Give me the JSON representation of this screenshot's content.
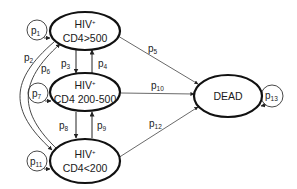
{
  "diagram": {
    "type": "state-transition",
    "nodes": [
      {
        "id": "n1",
        "line1": "HIV",
        "sup": "+",
        "line2": "CD4>500"
      },
      {
        "id": "n2",
        "line1": "HIV",
        "sup": "+",
        "line2": "CD4 200-500"
      },
      {
        "id": "n3",
        "line1": "HIV",
        "sup": "+",
        "line2": "CD4<200"
      },
      {
        "id": "dead",
        "label": "DEAD"
      }
    ],
    "edges": [
      {
        "from": "n1",
        "to": "n1",
        "base": "p",
        "sub": "1"
      },
      {
        "from": "n1",
        "to": "n3",
        "base": "p",
        "sub": "2"
      },
      {
        "from": "n1",
        "to": "n2",
        "base": "p",
        "sub": "3"
      },
      {
        "from": "n2",
        "to": "n1",
        "base": "p",
        "sub": "4"
      },
      {
        "from": "n1",
        "to": "dead",
        "base": "p",
        "sub": "5"
      },
      {
        "from": "n3",
        "to": "n1",
        "base": "p",
        "sub": "6"
      },
      {
        "from": "n2",
        "to": "n2",
        "base": "p",
        "sub": "7"
      },
      {
        "from": "n2",
        "to": "n3",
        "base": "p",
        "sub": "8"
      },
      {
        "from": "n3",
        "to": "n2",
        "base": "p",
        "sub": "9"
      },
      {
        "from": "n2",
        "to": "dead",
        "base": "p",
        "sub": "10"
      },
      {
        "from": "n3",
        "to": "n3",
        "base": "p",
        "sub": "11"
      },
      {
        "from": "n3",
        "to": "dead",
        "base": "p",
        "sub": "12"
      },
      {
        "from": "dead",
        "to": "dead",
        "base": "p",
        "sub": "13"
      }
    ]
  }
}
